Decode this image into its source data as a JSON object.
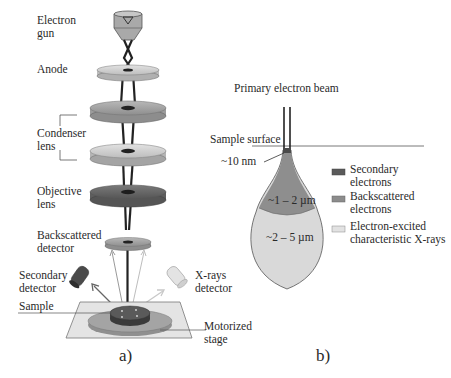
{
  "panel_a": {
    "caption": "a)",
    "labels": {
      "electron_gun": [
        "Electron",
        "gun"
      ],
      "anode": "Anode",
      "condenser_lens": [
        "Condenser",
        "lens"
      ],
      "objective_lens": [
        "Objective",
        "lens"
      ],
      "backscattered_detector": [
        "Backscattered",
        "detector"
      ],
      "secondary_detector": [
        "Secondary",
        "detector"
      ],
      "xrays_detector": [
        "X-rays",
        "detector"
      ],
      "sample": "Sample",
      "motorized_stage": [
        "Motorized",
        "stage"
      ]
    }
  },
  "panel_b": {
    "caption": "b)",
    "title": "Primary electron beam",
    "sample_surface": "Sample surface",
    "depth_label": "~10 nm",
    "inner_region": "~1 – 2 µm",
    "outer_region": "~2 – 5 µm",
    "legend": [
      {
        "label": [
          "Secondary",
          "electrons"
        ],
        "color": "#5a5a5a"
      },
      {
        "label": [
          "Backscattered",
          "electrons"
        ],
        "color": "#8c8c8c"
      },
      {
        "label": [
          "Electron-excited",
          "characteristic X-rays"
        ],
        "color": "#d8d8d8"
      }
    ]
  },
  "colors": {
    "light_disc": "#d0d0d0",
    "mid_disc": "#a8a8a8",
    "dark_disc": "#6e6e6e",
    "beam": "#222222"
  }
}
